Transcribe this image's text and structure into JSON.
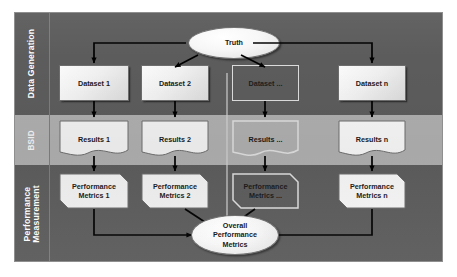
{
  "diagram": {
    "colors": {
      "band_dark": "#5c5c5c",
      "band_light": "#adadad",
      "node_fill": "#f0f0f0",
      "node_border": "#6d6d6d",
      "ghost_border": "#dcdcdc",
      "arrow": "#000000",
      "label_text": "#ffffff"
    },
    "bands": [
      {
        "id": "data-generation",
        "label": "Data Generation",
        "style": "dark"
      },
      {
        "id": "bsid",
        "label": "BSID",
        "style": "light"
      },
      {
        "id": "performance-measurement",
        "label": "Performance Measurement",
        "style": "dark"
      }
    ],
    "nodes": {
      "truth": "Truth",
      "datasets": [
        {
          "label": "Dataset 1",
          "ghost": false
        },
        {
          "label": "Dataset 2",
          "ghost": false
        },
        {
          "label": "Dataset ...",
          "ghost": true
        },
        {
          "label": "Dataset n",
          "ghost": false
        }
      ],
      "results": [
        {
          "label": "Results 1",
          "ghost": false
        },
        {
          "label": "Results 2",
          "ghost": false
        },
        {
          "label": "Results ...",
          "ghost": true
        },
        {
          "label": "Results n",
          "ghost": false
        }
      ],
      "metrics": [
        {
          "line1": "Performance",
          "line2": "Metrics 1",
          "ghost": false
        },
        {
          "line1": "Performance",
          "line2": "Metrics 2",
          "ghost": false
        },
        {
          "line1": "Performance",
          "line2": "Metrics ...",
          "ghost": true
        },
        {
          "line1": "Performance",
          "line2": "Metrics n",
          "ghost": false
        }
      ],
      "overall": {
        "line1": "Overall",
        "line2": "Performance",
        "line3": "Metrics"
      }
    }
  }
}
